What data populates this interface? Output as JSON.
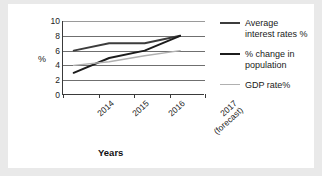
{
  "chart_data": {
    "type": "line",
    "title": "",
    "xlabel": "Years",
    "ylabel": "%",
    "categories": [
      "2014",
      "2015",
      "2016",
      "2017 (forecast)"
    ],
    "x_tick_labels": [
      {
        "line1": "2014",
        "line2": ""
      },
      {
        "line1": "2015",
        "line2": ""
      },
      {
        "line1": "2016",
        "line2": ""
      },
      {
        "line1": "2017",
        "line2": "(forecast)"
      }
    ],
    "ylim": [
      0,
      10
    ],
    "y_ticks": [
      0,
      2,
      4,
      6,
      8,
      10
    ],
    "grid": true,
    "legend_position": "right",
    "series": [
      {
        "name": "Average interest rates %",
        "legend_line1": "Average",
        "legend_line2": "interest rates %",
        "color": "#3c3c3c",
        "width": 1.9,
        "values": [
          6,
          7,
          7,
          8
        ]
      },
      {
        "name": "% change in population",
        "legend_line1": "% change in",
        "legend_line2": "population",
        "color": "#1c1c1c",
        "width": 1.9,
        "values": [
          3,
          5,
          6,
          8
        ]
      },
      {
        "name": "GDP rate%",
        "legend_line1": "GDP rate%",
        "legend_line2": "",
        "color": "#b0b0b0",
        "width": 1.4,
        "values": [
          4,
          4.5,
          5.3,
          6
        ]
      }
    ]
  },
  "axis": {
    "y_title": "%",
    "x_title": "Years",
    "y_tick_0": "0",
    "y_tick_1": "2",
    "y_tick_2": "4",
    "y_tick_3": "6",
    "y_tick_4": "8",
    "y_tick_5": "10"
  },
  "legend": {
    "items": [
      {
        "line1": "Average",
        "line2": "interest rates %"
      },
      {
        "line1": "% change in",
        "line2": "population"
      },
      {
        "line1": "GDP rate%",
        "line2": ""
      }
    ]
  },
  "colors": {
    "background": "#e9e9e9",
    "card": "#ffffff",
    "axis": "#3a3a3a",
    "grid": "#6f6f6f",
    "series_average": "#3c3c3c",
    "series_population": "#1c1c1c",
    "series_gdp": "#b0b0b0"
  }
}
